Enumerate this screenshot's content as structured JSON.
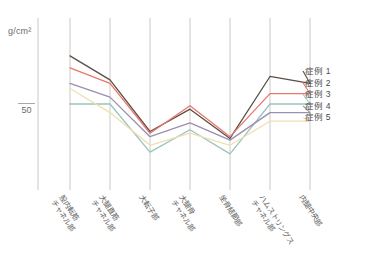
{
  "chart_data": {
    "type": "line",
    "title": "",
    "subtitle": "",
    "xlabel": "",
    "ylabel": "g/cm²",
    "y_unit_label": "g/cm²",
    "grid": true,
    "grid_orientation": "vertical",
    "legend_position": "right",
    "ylim": [
      0,
      100
    ],
    "yticks": [
      50
    ],
    "ytick_labels": [
      "50"
    ],
    "categories": [
      "股内転筋チャネル部",
      "大腿直筋チャネル部",
      "大転子部",
      "大腿骨チャネル部",
      "坐骨結節部",
      "ハムストリングスチャネル部",
      "内腿中央部"
    ],
    "category_lines": [
      [
        "股内転筋",
        "チャネル部"
      ],
      [
        "大腿直筋",
        "チャネル部"
      ],
      [
        "大転子部"
      ],
      [
        "大腿骨",
        "チャネル部"
      ],
      [
        "坐骨結節部"
      ],
      [
        "ハムストリングス",
        "チャネル部"
      ],
      [
        "内腿中央部"
      ]
    ],
    "series": [
      {
        "name": "症例 1",
        "color": "#5c4f45",
        "values": [
          78,
          64,
          34,
          47,
          30,
          66,
          62
        ]
      },
      {
        "name": "症例 2",
        "color": "#e8776a",
        "values": [
          71,
          62,
          33,
          49,
          31,
          56,
          56
        ]
      },
      {
        "name": "症例 3",
        "color": "#9ac4bd",
        "values": [
          50,
          50,
          22,
          35,
          21,
          50,
          50
        ]
      },
      {
        "name": "症例 4",
        "color": "#9a8fae",
        "values": [
          62,
          54,
          31,
          39,
          29,
          45,
          45
        ]
      },
      {
        "name": "症例 5",
        "color": "#f0dfb0",
        "values": [
          59,
          45,
          26,
          33,
          26,
          40,
          40
        ]
      }
    ]
  },
  "legend": {
    "items": [
      {
        "label": "症例 1"
      },
      {
        "label": "症例 2"
      },
      {
        "label": "症例 3"
      },
      {
        "label": "症例 4"
      },
      {
        "label": "症例 5"
      }
    ]
  }
}
